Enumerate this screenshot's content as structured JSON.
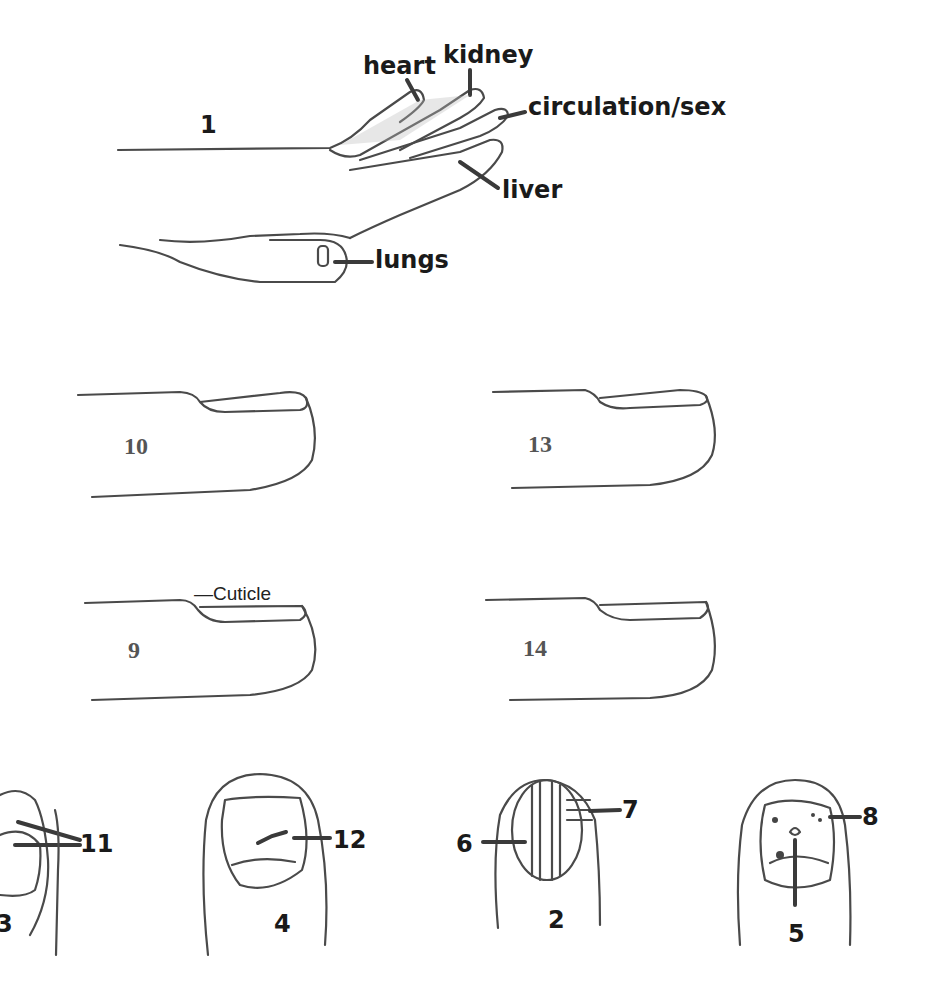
{
  "figure": {
    "hand": {
      "number": "1",
      "labels": {
        "heart": "heart",
        "kidney": "kidney",
        "circulation": "circulation/sex",
        "liver": "liver",
        "lungs": "lungs"
      }
    },
    "side_fingers": [
      {
        "number": "10"
      },
      {
        "number": "13"
      },
      {
        "number": "9",
        "annotation": "—Cuticle"
      },
      {
        "number": "14"
      }
    ],
    "nails": [
      {
        "number": "3",
        "marker": "11"
      },
      {
        "number": "4",
        "marker": "12"
      },
      {
        "number": "2",
        "marker_left": "6",
        "marker_right": "7"
      },
      {
        "number": "5",
        "marker": "8"
      }
    ]
  }
}
